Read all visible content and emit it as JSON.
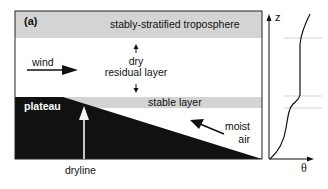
{
  "panel_label": "(a)",
  "layers": {
    "top": "stably-stratified troposphere",
    "residual_line1": "dry",
    "residual_line2": "residual layer",
    "stable": "stable layer"
  },
  "labels": {
    "wind": "wind",
    "plateau": "plateau",
    "moist_line1": "moist",
    "moist_line2": "air",
    "dryline": "dryline"
  },
  "profile_axes": {
    "y_label": "z",
    "x_label": "θ"
  },
  "colors": {
    "band_gray": "#d4d4d4",
    "terrain": "#111111",
    "outline": "#222222",
    "guide_line": "#c8c8c8"
  }
}
